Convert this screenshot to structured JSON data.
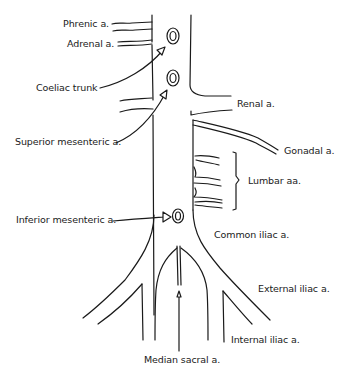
{
  "diagram": {
    "labels": {
      "phrenic": "Phrenic a.",
      "adrenal": "Adrenal a.",
      "coeliac": "Coeliac trunk",
      "renal": "Renal a.",
      "superior_mesenteric": "Superior mesenteric a.",
      "gonadal": "Gonadal a.",
      "lumbar": "Lumbar aa.",
      "inferior_mesenteric": "Inferior mesenteric a.",
      "common_iliac": "Common iliac a.",
      "external_iliac": "External iliac a.",
      "internal_iliac": "Internal iliac a.",
      "median_sacral": "Median sacral a."
    },
    "colors": {
      "stroke": "#1a1a1a",
      "background": "#ffffff"
    }
  }
}
